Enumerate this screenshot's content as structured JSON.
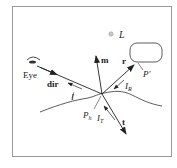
{
  "diagram": {
    "labels": {
      "light": "L",
      "eye": "Eye",
      "dir": "dir",
      "normal": "m",
      "reflect": "r",
      "transmit": "t",
      "incident_intensity": "I",
      "reflected_intensity": "I",
      "reflected_sub": "R",
      "transmitted_intensity": "I",
      "transmitted_sub": "T",
      "hit_point": "P",
      "hit_sub": "h",
      "object_point": "P'"
    },
    "colors": {
      "stroke": "#222222",
      "border": "#9a9a9a",
      "light_source": "#b0b0b0"
    }
  }
}
